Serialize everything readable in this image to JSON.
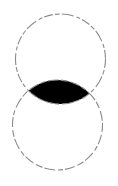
{
  "diagram": {
    "type": "venn-intersection",
    "colors": {
      "background": "#ffffff",
      "outline": "#8a8a8a",
      "intersection_fill": "#000000"
    },
    "circles": [
      {
        "name": "top-circle",
        "cx": 60.5,
        "cy": 59,
        "r": 45
      },
      {
        "name": "bottom-circle",
        "cx": 57.5,
        "cy": 125,
        "r": 45
      }
    ]
  }
}
